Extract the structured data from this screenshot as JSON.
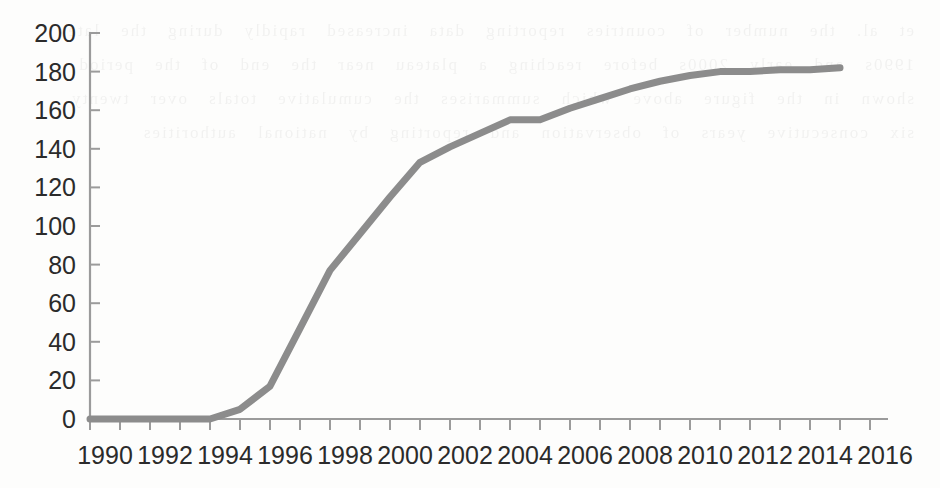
{
  "chart_data": {
    "type": "line",
    "title": "",
    "subtitle": "",
    "xlabel": "",
    "ylabel": "",
    "xlim": [
      1990,
      2016
    ],
    "ylim": [
      0,
      200
    ],
    "grid": false,
    "legend": false,
    "legend_position": "none",
    "line_color": "#8c8c8c",
    "axis_color": "#9b9b9b",
    "text_color": "#2b2b2b",
    "y_ticks": [
      0,
      20,
      40,
      60,
      80,
      100,
      120,
      140,
      160,
      180,
      200
    ],
    "y_tick_labels": [
      "0",
      "20",
      "40",
      "60",
      "80",
      "100",
      "120",
      "140",
      "160",
      "180",
      "200"
    ],
    "x_ticks": [
      1990,
      1992,
      1994,
      1996,
      1998,
      2000,
      2002,
      2004,
      2006,
      2008,
      2010,
      2012,
      2014,
      2016
    ],
    "x_tick_labels": [
      "1990",
      "1992",
      "1994",
      "1996",
      "1998",
      "2000",
      "2002",
      "2004",
      "2006",
      "2008",
      "2010",
      "2012",
      "2014",
      "2016"
    ],
    "x_minor_tick_interval": 1,
    "series": [
      {
        "name": "cumulative-count",
        "x": [
          1990,
          1991,
          1992,
          1993,
          1994,
          1995,
          1996,
          1997,
          1998,
          1999,
          2000,
          2001,
          2002,
          2003,
          2004,
          2005,
          2006,
          2007,
          2008,
          2009,
          2010,
          2011,
          2012,
          2013,
          2014,
          2015
        ],
        "values": [
          0,
          0,
          0,
          0,
          0,
          5,
          17,
          47,
          77,
          96,
          115,
          133,
          141,
          148,
          155,
          155,
          161,
          166,
          171,
          175,
          178,
          180,
          180,
          181,
          181,
          182
        ]
      }
    ]
  },
  "artifacts": {
    "bleed_text": "et al. the number of countries reporting data increased rapidly during the late 1990s and early 2000s before reaching a plateau near the end of the period shown in the figure above which summarises the cumulative totals over twenty six consecutive years of observation and reporting by national authorities"
  }
}
